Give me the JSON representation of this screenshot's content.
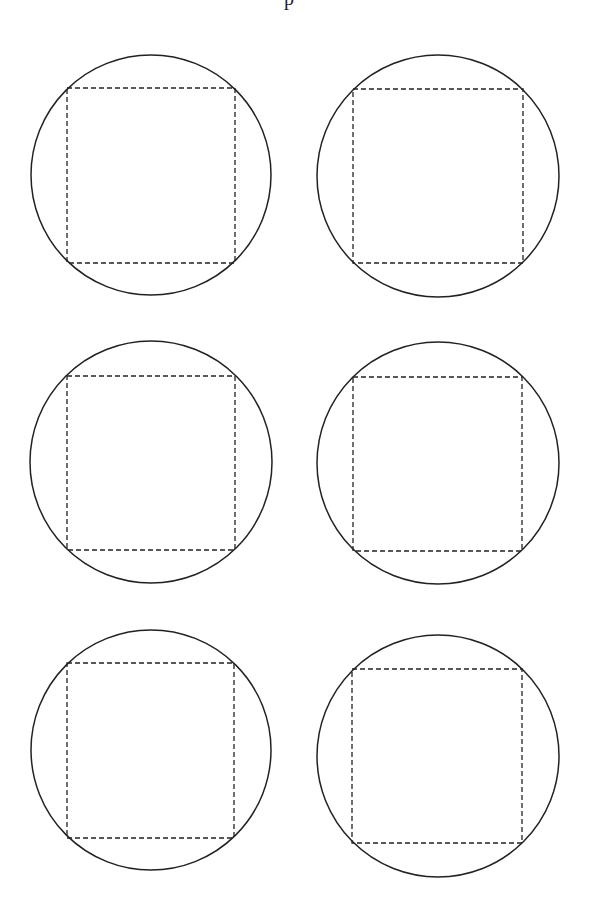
{
  "document": {
    "type": "printable template",
    "top_cutoff_text": "p",
    "layout": {
      "rows": 3,
      "columns": 2
    },
    "colors": {
      "background": "#ffffff",
      "stroke": "#222222"
    },
    "shapes": [
      {
        "id": 1,
        "circle": {
          "cx": 151,
          "cy": 175,
          "r": 120
        },
        "square": {
          "x": 67,
          "y": 88,
          "w": 168,
          "h": 175
        }
      },
      {
        "id": 2,
        "circle": {
          "cx": 438,
          "cy": 176,
          "r": 121
        },
        "square": {
          "x": 353,
          "y": 89,
          "w": 170,
          "h": 174
        }
      },
      {
        "id": 3,
        "circle": {
          "cx": 151,
          "cy": 462,
          "r": 121
        },
        "square": {
          "x": 67,
          "y": 376,
          "w": 168,
          "h": 174
        }
      },
      {
        "id": 4,
        "circle": {
          "cx": 438,
          "cy": 463,
          "r": 121
        },
        "square": {
          "x": 353,
          "y": 377,
          "w": 169,
          "h": 174
        }
      },
      {
        "id": 5,
        "circle": {
          "cx": 151,
          "cy": 750,
          "r": 120
        },
        "square": {
          "x": 67,
          "y": 663,
          "w": 167,
          "h": 175
        }
      },
      {
        "id": 6,
        "circle": {
          "cx": 438,
          "cy": 756,
          "r": 121
        },
        "square": {
          "x": 352,
          "y": 669,
          "w": 170,
          "h": 174
        }
      }
    ]
  }
}
